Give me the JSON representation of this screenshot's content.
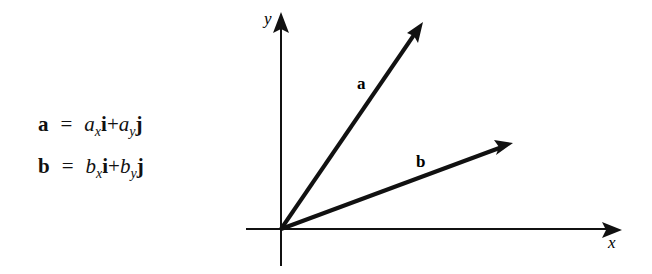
{
  "equations": [
    {
      "lhs": "a",
      "eq": "=",
      "c1": "a",
      "s1": "x",
      "u1": "i",
      "plus": "+",
      "c2": "a",
      "s2": "y",
      "u2": "j"
    },
    {
      "lhs": "b",
      "eq": "=",
      "c1": "b",
      "s1": "x",
      "u1": "i",
      "plus": "+",
      "c2": "b",
      "s2": "y",
      "u2": "j"
    }
  ],
  "axes": {
    "x_label": "x",
    "y_label": "y"
  },
  "vectors": [
    {
      "name": "a",
      "label": "a",
      "from": [
        281,
        229
      ],
      "to": [
        423,
        22
      ]
    },
    {
      "name": "b",
      "label": "b",
      "from": [
        281,
        229
      ],
      "to": [
        513,
        143
      ]
    }
  ],
  "colors": {
    "ink": "#111111",
    "background": "#ffffff"
  }
}
